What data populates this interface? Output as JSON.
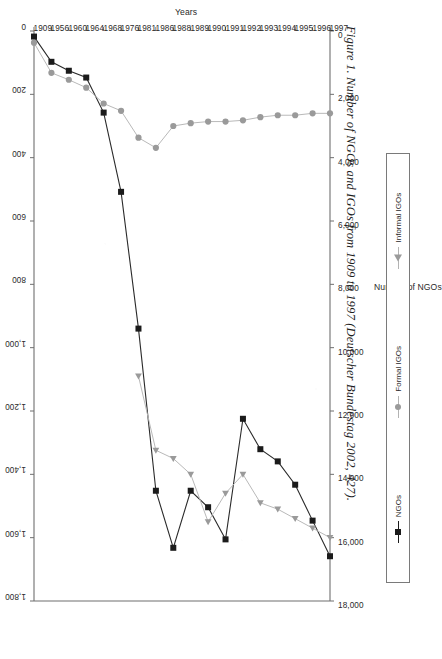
{
  "caption": "Figure 1. Number of NGOs and IGOs from 1909 to 1997 (Deutscher Bundestag 2002, 427).",
  "legend": {
    "items": [
      {
        "label": "NGOs",
        "marker": "square",
        "color": "#1b1b1b"
      },
      {
        "label": "Formal IGOs",
        "marker": "circle",
        "color": "#9a9a9a"
      },
      {
        "label": "Informal IGOs",
        "marker": "triangle",
        "color": "#9a9a9a"
      }
    ]
  },
  "chart_data": {
    "type": "line",
    "title": "",
    "xlabel": "Years",
    "ylabel": "Number of NGOs",
    "y2label": "Number of IGOs",
    "grid": false,
    "legend_position": "bottom-right",
    "categories": [
      "1909",
      "1956",
      "1960",
      "1964",
      "1968",
      "1976",
      "1981",
      "1986",
      "1988",
      "1989",
      "1990",
      "1991",
      "1992",
      "1993",
      "1994",
      "1995",
      "1996",
      "1997"
    ],
    "ylim": [
      0,
      18000
    ],
    "yticks": [
      "0",
      "2,000",
      "4,000",
      "6,000",
      "8,000",
      "10,000",
      "12,000",
      "14,000",
      "16,000",
      "18,000"
    ],
    "y2lim": [
      0,
      1800
    ],
    "y2ticks": [
      "0",
      "200",
      "400",
      "600",
      "800",
      "1,000",
      "1,200",
      "1,400",
      "1,600",
      "1,800"
    ],
    "series": [
      {
        "name": "NGOs",
        "axis": "left",
        "marker": "square",
        "color": "#1b1b1b",
        "values": [
          176,
          973,
          1255,
          1470,
          2577,
          5079,
          9398,
          14518,
          16320,
          14518,
          15039,
          16054,
          12246,
          13206,
          13591,
          14328,
          15462,
          16586
        ]
      },
      {
        "name": "Formal IGOs",
        "axis": "right",
        "marker": "circle",
        "color": "#9a9a9a",
        "values": [
          37,
          132,
          154,
          179,
          229,
          252,
          337,
          369,
          300,
          291,
          286,
          286,
          282,
          272,
          266,
          266,
          260,
          260
        ]
      },
      {
        "name": "Informal IGOs",
        "axis": "right",
        "marker": "triangle",
        "color": "#9a9a9a",
        "values": [
          null,
          null,
          null,
          null,
          null,
          null,
          1090,
          1324,
          1350,
          1400,
          1550,
          1460,
          1400,
          1490,
          1510,
          1540,
          1570,
          1600
        ]
      }
    ]
  }
}
